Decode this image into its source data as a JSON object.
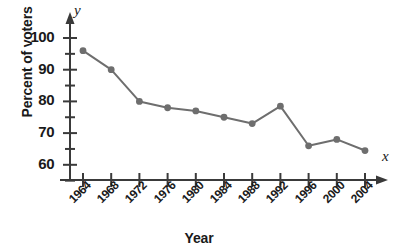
{
  "chart_data": {
    "type": "line",
    "title": "",
    "subtitle": "",
    "xlabel": "Year",
    "ylabel": "Percent of voters",
    "categories": [
      "1964",
      "1968",
      "1972",
      "1976",
      "1980",
      "1984",
      "1988",
      "1992",
      "1996",
      "2000",
      "2004"
    ],
    "values": [
      96,
      90,
      80,
      78,
      77,
      75,
      73,
      78.5,
      66,
      68,
      64.5
    ],
    "series": [
      {
        "name": "Percent of voters",
        "values": [
          96,
          90,
          80,
          78,
          77,
          75,
          73,
          78.5,
          66,
          68,
          64.5
        ]
      }
    ],
    "ylim": [
      55,
      102
    ],
    "ytick_labels": [
      "60",
      "70",
      "80",
      "90",
      "100"
    ],
    "ytick_values": [
      60,
      70,
      80,
      90,
      100
    ],
    "yminor_step": 5,
    "grid": false,
    "legend": "none",
    "line_color": "#6e6e6e",
    "marker_color": "#6e6e6e",
    "axis_color": "#3a3a3a"
  },
  "axes": {
    "y_variable_label": "y",
    "x_variable_label": "x",
    "y_axis_title": "Percent of voters",
    "x_axis_title": "Year"
  }
}
